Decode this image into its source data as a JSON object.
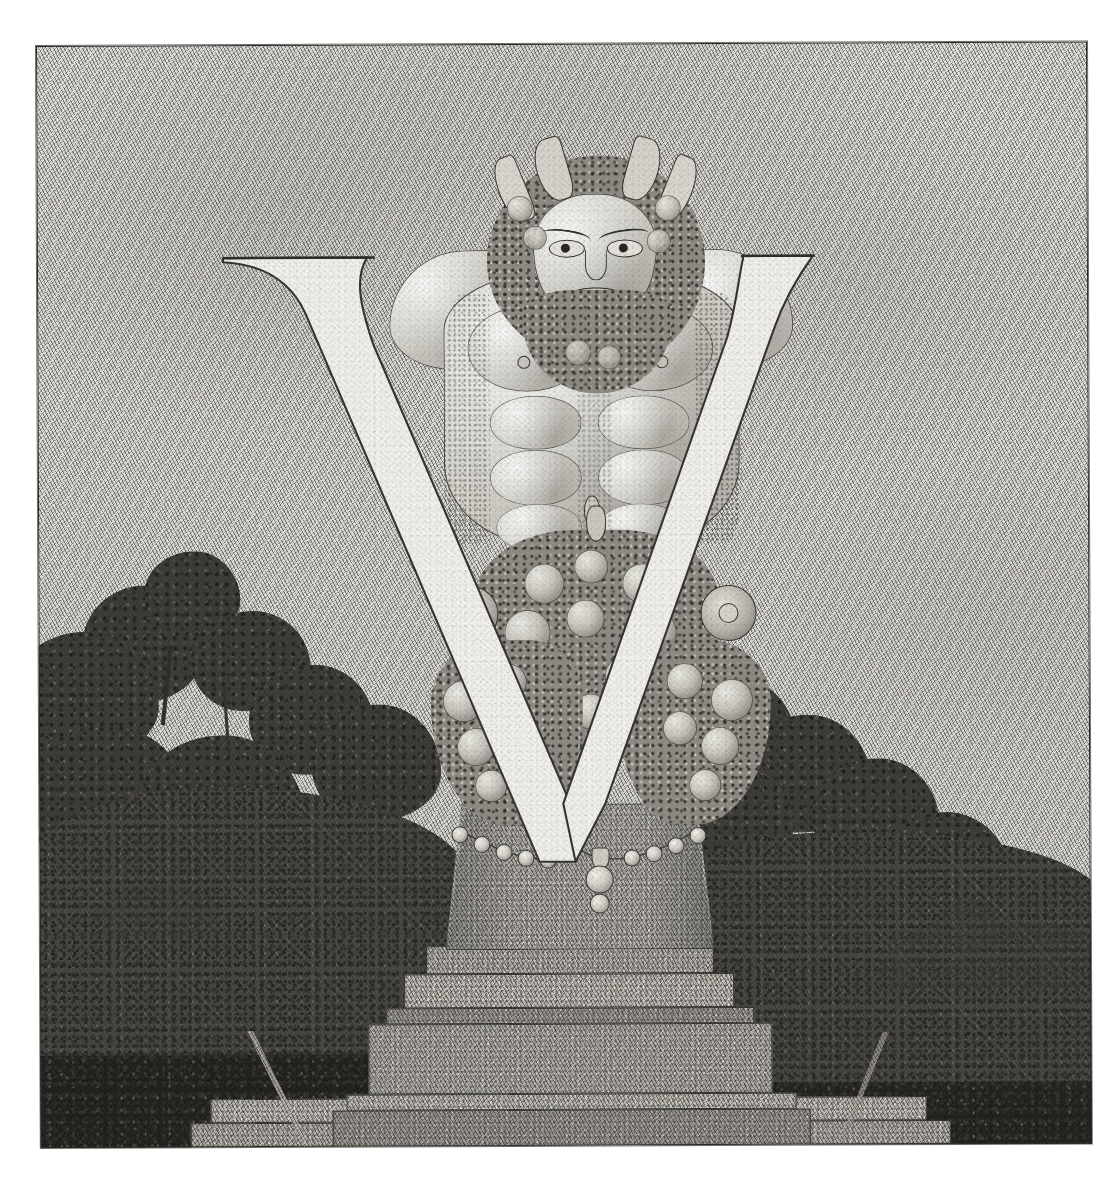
{
  "artwork": {
    "title": "Ornamental Initial Letter V",
    "subject": "Grotesque herm / satyr term supporting the letter V",
    "letter": "V",
    "medium": "pen-and-ink engraving reproduction on textured paper",
    "palette": {
      "paper": "#dedcd7",
      "paper_light": "#e3e1dc",
      "ink": "#2b2a28",
      "letter_fill": "#f2f0ea",
      "letter_outline": "#333230",
      "stone": "#b4b2ab",
      "stone_dark": "#9c9a93",
      "stone_light": "#c4c2ba",
      "foliage_dark": "#242320",
      "foliage_mid": "#4b4944",
      "flesh": "#d3d1c9",
      "border": "#2b2a28"
    },
    "frame": {
      "left": 36,
      "top": 46,
      "width": 1051,
      "height": 1102,
      "rotation_deg": -0.25,
      "border_label": "engraved plate border"
    },
    "elements": [
      {
        "name": "sky",
        "label": "Pale stippled sky"
      },
      {
        "name": "left-tree-mass",
        "label": "Dark mass of trees at left"
      },
      {
        "name": "right-tree-mass",
        "label": "Dark mass of trees at right"
      },
      {
        "name": "distant-trees",
        "label": "Distant low trees on the horizon"
      },
      {
        "name": "grotesque-head",
        "label": "Bearded grotesque head with horns and pointed ears"
      },
      {
        "name": "grotesque-torso",
        "label": "Muscular nude torso with pectorals and abdominals"
      },
      {
        "name": "fruit-garland-center",
        "label": "Central cluster of fruit, grapes and leaves"
      },
      {
        "name": "fruit-garland-left",
        "label": "Left hanging fruit garland with rosette"
      },
      {
        "name": "fruit-garland-right",
        "label": "Right hanging fruit garland with rosette"
      },
      {
        "name": "pearl-swag",
        "label": "Swag of pearls with pendant drop"
      },
      {
        "name": "herm-shaft",
        "label": "Tapering stone herm shaft"
      },
      {
        "name": "pedestal-steps",
        "label": "Stepped stone pedestal of four courses"
      },
      {
        "name": "terrace-path",
        "label": "Pale stone terrace and path at the foot"
      },
      {
        "name": "letter-v",
        "label": "Large white serifed capital letter V"
      }
    ],
    "letter_geometry": {
      "left_serif_left_x": 222,
      "left_serif_right_x": 366,
      "serif_top_y": 259,
      "right_serif_left_x": 742,
      "right_serif_right_x": 812,
      "apex_x": 560,
      "apex_y": 806,
      "stroke_note": "thick left diagonal, thin right diagonal, flat top serifs"
    }
  }
}
